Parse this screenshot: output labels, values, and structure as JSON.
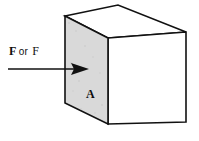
{
  "figure": {
    "name": "force-on-cube-face",
    "background_color": "#ffffff",
    "stroke_color": "#111111",
    "shaded_face_color": "#d9d9d9",
    "plain_face_color": "#ffffff",
    "labels": {
      "force_vector": "F",
      "force_conjunction": "or",
      "force_scalar": "F",
      "force_full": "F or F",
      "area": "A"
    },
    "arrow": {
      "name": "force-arrow",
      "direction": "right",
      "start_x": 8,
      "end_x": 89,
      "y": 69,
      "head_style": "solid-triangle"
    },
    "cube": {
      "type": "isometric-cube",
      "faces": [
        {
          "name": "left-front-face",
          "fill": "#d9d9d9",
          "label": "A"
        },
        {
          "name": "right-front-face",
          "fill": "#ffffff",
          "label": ""
        },
        {
          "name": "top-face",
          "fill": "#ffffff",
          "label": ""
        }
      ],
      "vertices": {
        "top_left": [
          65,
          16
        ],
        "top_back": [
          118,
          5
        ],
        "top_right": [
          186,
          32
        ],
        "top_front": [
          108,
          38
        ],
        "bottom_left": [
          65,
          103
        ],
        "bottom_front": [
          108,
          124
        ],
        "bottom_right": [
          186,
          122
        ]
      }
    }
  }
}
